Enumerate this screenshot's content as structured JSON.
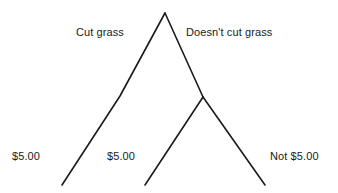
{
  "diagram": {
    "type": "decision-tree",
    "line_color": "#1a1a1a",
    "background_color": "#ffffff",
    "branch_labels": {
      "left": "Cut grass",
      "right": "Doesn't cut grass"
    },
    "payoff_labels": {
      "left": "$5.00",
      "middle": "$5.00",
      "right": "Not $5.00"
    },
    "nodes": {
      "root": {
        "x": 165,
        "y": 13
      },
      "left_kink": {
        "x": 120,
        "y": 96
      },
      "left_end": {
        "x": 62,
        "y": 185
      },
      "right_junction": {
        "x": 203,
        "y": 97
      },
      "middle_end": {
        "x": 145,
        "y": 185
      },
      "right_end": {
        "x": 265,
        "y": 185
      }
    },
    "edges": [
      {
        "name": "root-to-left",
        "points": "165,13 120,96 62,185"
      },
      {
        "name": "root-to-junction",
        "points": "165,13 203,97"
      },
      {
        "name": "junction-to-middle",
        "points": "203,97 145,185"
      },
      {
        "name": "junction-to-right",
        "points": "203,97 265,185"
      }
    ]
  }
}
